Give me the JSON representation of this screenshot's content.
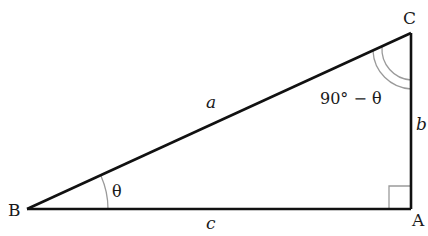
{
  "diagram": {
    "type": "right-triangle",
    "vertices": {
      "B": {
        "label": "B",
        "x": 27,
        "y": 209
      },
      "A": {
        "label": "A",
        "x": 411,
        "y": 209
      },
      "C": {
        "label": "C",
        "x": 411,
        "y": 33
      }
    },
    "sides": {
      "a": {
        "label": "a",
        "between": "B-C"
      },
      "b": {
        "label": "b",
        "between": "A-C"
      },
      "c": {
        "label": "c",
        "between": "B-A"
      }
    },
    "angles": {
      "B": {
        "label": "θ"
      },
      "C": {
        "label": "90° − θ"
      },
      "A": {
        "label": "right angle"
      }
    },
    "colors": {
      "line": "#111111",
      "arc": "#999999",
      "right_angle_mark": "#999999"
    }
  }
}
